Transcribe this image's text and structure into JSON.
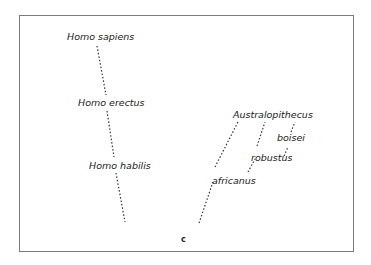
{
  "diagram": {
    "type": "phylogeny",
    "panel_label": "c",
    "lineages": {
      "homo": {
        "labels": [
          "Homo sapiens",
          "Homo erectus",
          "Homo habilis"
        ]
      },
      "australopithecus": {
        "labels": [
          "Australopithecus",
          "africanus",
          "robustus",
          "boisei"
        ]
      }
    },
    "colors": {
      "line": "#333333",
      "text": "#222222",
      "frame": "#7a7a7a"
    }
  }
}
